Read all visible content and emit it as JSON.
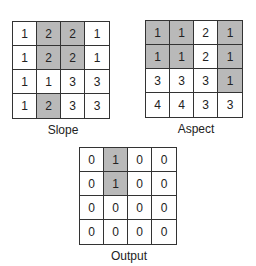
{
  "colors": {
    "shaded": "#b9b9b9",
    "unshaded": "#ffffff",
    "grid_line": "#333333"
  },
  "grids": {
    "slope": {
      "label": "Slope",
      "values": [
        [
          1,
          2,
          2,
          1
        ],
        [
          1,
          2,
          2,
          1
        ],
        [
          1,
          1,
          3,
          3
        ],
        [
          1,
          2,
          3,
          3
        ]
      ],
      "shaded": [
        [
          false,
          true,
          true,
          false
        ],
        [
          false,
          true,
          true,
          false
        ],
        [
          false,
          false,
          false,
          false
        ],
        [
          false,
          true,
          false,
          false
        ]
      ]
    },
    "aspect": {
      "label": "Aspect",
      "values": [
        [
          1,
          1,
          2,
          1
        ],
        [
          1,
          1,
          2,
          1
        ],
        [
          3,
          3,
          3,
          1
        ],
        [
          4,
          4,
          3,
          3
        ]
      ],
      "shaded": [
        [
          true,
          true,
          false,
          true
        ],
        [
          true,
          true,
          false,
          true
        ],
        [
          false,
          false,
          false,
          true
        ],
        [
          false,
          false,
          false,
          false
        ]
      ]
    },
    "output": {
      "label": "Output",
      "values": [
        [
          0,
          1,
          0,
          0
        ],
        [
          0,
          1,
          0,
          0
        ],
        [
          0,
          0,
          0,
          0
        ],
        [
          0,
          0,
          0,
          0
        ]
      ],
      "shaded": [
        [
          false,
          true,
          false,
          false
        ],
        [
          false,
          true,
          false,
          false
        ],
        [
          false,
          false,
          false,
          false
        ],
        [
          false,
          false,
          false,
          false
        ]
      ]
    }
  }
}
